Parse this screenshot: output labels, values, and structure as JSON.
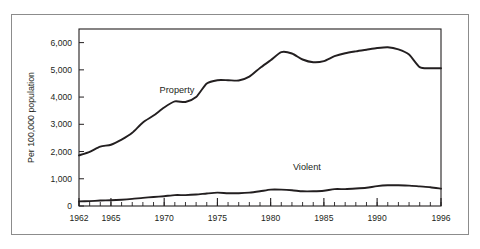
{
  "chart_data": {
    "type": "line",
    "title": "",
    "xlabel": "",
    "ylabel": "Per 100,000 population",
    "xlim": [
      1962,
      1996
    ],
    "ylim": [
      0,
      6500
    ],
    "grid": false,
    "legend_position": "inline-annotation",
    "y_ticks": [
      "0",
      "1,000",
      "2,000",
      "3,000",
      "4,000",
      "5,000",
      "6,000"
    ],
    "y_tick_values": [
      0,
      1000,
      2000,
      3000,
      4000,
      5000,
      6000
    ],
    "x_ticks": [
      "1962",
      "1965",
      "1970",
      "1975",
      "1980",
      "1985",
      "1990",
      "1996"
    ],
    "x_tick_values": [
      1962,
      1965,
      1970,
      1975,
      1980,
      1985,
      1990,
      1996
    ],
    "x_minor_step": 1,
    "x": [
      1962,
      1963,
      1964,
      1965,
      1966,
      1967,
      1968,
      1969,
      1970,
      1971,
      1972,
      1973,
      1974,
      1975,
      1976,
      1977,
      1978,
      1979,
      1980,
      1981,
      1982,
      1983,
      1984,
      1985,
      1986,
      1987,
      1988,
      1989,
      1990,
      1991,
      1992,
      1993,
      1994,
      1995,
      1996
    ],
    "series": [
      {
        "name": "Property",
        "label": "Property",
        "color": "#231f20",
        "values": [
          1860,
          1990,
          2180,
          2250,
          2440,
          2690,
          3070,
          3320,
          3620,
          3840,
          3820,
          4000,
          4500,
          4620,
          4620,
          4610,
          4750,
          5070,
          5350,
          5650,
          5600,
          5380,
          5280,
          5320,
          5500,
          5610,
          5680,
          5740,
          5800,
          5830,
          5750,
          5560,
          5100,
          5060,
          5060
        ]
      },
      {
        "name": "Violent",
        "label": "Violent",
        "color": "#231f20",
        "values": [
          170,
          180,
          200,
          210,
          230,
          260,
          300,
          330,
          360,
          400,
          400,
          420,
          460,
          490,
          470,
          470,
          490,
          540,
          600,
          600,
          580,
          540,
          540,
          560,
          620,
          620,
          640,
          670,
          730,
          760,
          760,
          750,
          720,
          690,
          640
        ]
      }
    ],
    "annotations": [
      {
        "text": "Property",
        "x": 1971.2,
        "y": 4150
      },
      {
        "text": "Violent",
        "x": 1983.4,
        "y": 1320
      }
    ]
  },
  "frame": {
    "outer_border_color": "#8c8c8c",
    "plot_border_color": "#231f20",
    "background": "#ffffff"
  }
}
